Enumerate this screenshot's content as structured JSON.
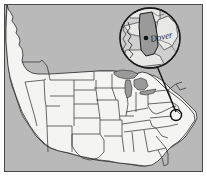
{
  "figure": {
    "name": "us-map-with-delaware-inset",
    "frame": {
      "x": 4,
      "y": 4,
      "width": 199,
      "height": 168
    }
  },
  "colors": {
    "water": "#b9b9b9",
    "land": "#f4f4f2",
    "state_border": "#2b2b2b",
    "frame_border": "#4a4a4a",
    "inset_fill": "#cfcfcf",
    "highlight_state": "#9a9a9a",
    "leader_line": "#111111",
    "label_text": "#1a1a1a",
    "city_dot": "#111111"
  },
  "base_map": {
    "name": "united-states-base-map",
    "country": "United States"
  },
  "inset": {
    "name": "delaware-magnifier-inset",
    "center": {
      "x": 150,
      "y": 38
    },
    "radius": 30,
    "highlighted_state": "Delaware",
    "city": {
      "name": "Dover",
      "label": "Dover",
      "label_x": 151,
      "label_y": 42,
      "dot_x": 146,
      "dot_y": 38
    }
  },
  "locator": {
    "name": "delaware-locator-marker",
    "center": {
      "x": 176,
      "y": 115
    },
    "radius": 5.5
  },
  "leader_line": {
    "from": {
      "x": 157,
      "y": 66
    },
    "to": {
      "x": 176,
      "y": 112
    }
  }
}
